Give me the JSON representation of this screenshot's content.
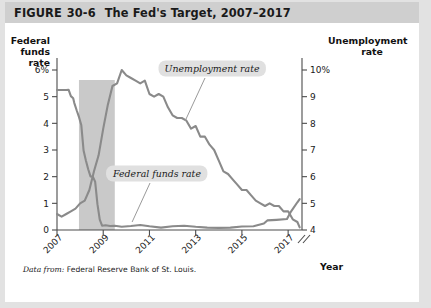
{
  "figure": {
    "header_prefix": "FIGURE",
    "number": "30-6",
    "title": "The Fed's Target, 2007–2017",
    "source_lead": "Data from:",
    "source_text": "Federal Reserve Bank of St. Louis."
  },
  "colors": {
    "header_band": "#cfcfcf",
    "frame": "#e2e2e2",
    "line": "#8a8a8a",
    "recession_band": "#c9c9c9",
    "callout_background": "#e0e0e0",
    "axis": "#4c4c4c"
  },
  "callouts": {
    "unemployment": "Unemployment rate",
    "federal_funds": "Federal funds rate"
  },
  "chart_data": {
    "type": "line",
    "title": "The Fed's Target, 2007–2017",
    "xlabel": "Year",
    "ylabel": "Federal funds rate",
    "y2label": "Unemployment rate",
    "grid": false,
    "legend_position": "inline-annotation",
    "xlim": [
      2007.0,
      2017.6
    ],
    "xticks": [
      "2007",
      "2009",
      "2011",
      "2013",
      "2015",
      "2017"
    ],
    "xtick_values": [
      2007,
      2009,
      2011,
      2013,
      2015,
      2017
    ],
    "ylim": [
      0,
      6
    ],
    "yticks": [
      "0",
      "1",
      "2",
      "3",
      "4",
      "5",
      "6%"
    ],
    "ytick_values": [
      0,
      1,
      2,
      3,
      4,
      5,
      6
    ],
    "y2lim": [
      4,
      10
    ],
    "y2ticks": [
      "4",
      "5",
      "6",
      "7",
      "8",
      "9",
      "10%"
    ],
    "y2tick_values": [
      4,
      5,
      6,
      7,
      8,
      9,
      10
    ],
    "y2_axis_break": true,
    "shaded_region": {
      "label": "recession",
      "x_start": 2007.95,
      "x_end": 2009.5
    },
    "series": [
      {
        "name": "Federal funds rate",
        "axis": "left",
        "x": [
          2007.0,
          2007.1,
          2007.2,
          2007.3,
          2007.4,
          2007.5,
          2007.6,
          2007.7,
          2007.75,
          2007.85,
          2007.95,
          2008.05,
          2008.15,
          2008.25,
          2008.35,
          2008.45,
          2008.55,
          2008.65,
          2008.75,
          2008.85,
          2008.95,
          2009.1,
          2009.3,
          2009.5,
          2009.8,
          2010.2,
          2010.6,
          2011.0,
          2011.5,
          2012.0,
          2012.5,
          2013.0,
          2013.5,
          2014.0,
          2014.5,
          2015.0,
          2015.5,
          2015.95,
          2016.1,
          2016.5,
          2016.95,
          2017.1,
          2017.4,
          2017.5
        ],
        "values": [
          5.25,
          5.25,
          5.25,
          5.25,
          5.25,
          5.26,
          5.02,
          4.94,
          4.76,
          4.49,
          4.24,
          3.94,
          2.98,
          2.61,
          2.28,
          2.01,
          2.0,
          1.81,
          0.97,
          0.39,
          0.16,
          0.18,
          0.15,
          0.16,
          0.12,
          0.15,
          0.19,
          0.14,
          0.09,
          0.14,
          0.16,
          0.12,
          0.09,
          0.08,
          0.09,
          0.13,
          0.14,
          0.24,
          0.36,
          0.38,
          0.41,
          0.66,
          1.04,
          1.16
        ]
      },
      {
        "name": "Unemployment rate",
        "axis": "right",
        "x": [
          2007.0,
          2007.2,
          2007.4,
          2007.6,
          2007.8,
          2008.0,
          2008.2,
          2008.4,
          2008.6,
          2008.8,
          2009.0,
          2009.2,
          2009.4,
          2009.6,
          2009.8,
          2010.0,
          2010.2,
          2010.4,
          2010.6,
          2010.8,
          2011.0,
          2011.2,
          2011.4,
          2011.6,
          2011.8,
          2012.0,
          2012.2,
          2012.4,
          2012.6,
          2012.8,
          2013.0,
          2013.2,
          2013.4,
          2013.6,
          2013.8,
          2014.0,
          2014.2,
          2014.4,
          2014.6,
          2014.8,
          2015.0,
          2015.2,
          2015.4,
          2015.6,
          2015.8,
          2016.0,
          2016.2,
          2016.4,
          2016.6,
          2016.8,
          2017.0,
          2017.2,
          2017.4,
          2017.5
        ],
        "values": [
          4.6,
          4.5,
          4.6,
          4.7,
          4.8,
          5.0,
          5.1,
          5.5,
          6.2,
          6.8,
          7.8,
          8.7,
          9.4,
          9.5,
          10.0,
          9.8,
          9.7,
          9.6,
          9.5,
          9.6,
          9.1,
          9.0,
          9.1,
          9.0,
          8.6,
          8.3,
          8.2,
          8.2,
          8.1,
          7.8,
          7.9,
          7.5,
          7.5,
          7.2,
          7.0,
          6.6,
          6.2,
          6.1,
          5.9,
          5.7,
          5.5,
          5.5,
          5.3,
          5.1,
          5.0,
          4.9,
          5.0,
          4.9,
          4.9,
          4.7,
          4.7,
          4.4,
          4.3,
          4.1
        ]
      }
    ]
  }
}
